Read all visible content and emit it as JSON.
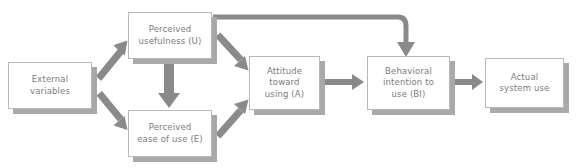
{
  "diagram": {
    "colors": {
      "box_fill": "#ffffff",
      "box_border": "#b9b9b9",
      "shadow": "#a9a9a9",
      "arrow": "#8a8a8a",
      "text": "#7c7c7c",
      "background": "#ffffff"
    },
    "nodes": [
      {
        "id": "external",
        "label": "External\nvariables",
        "x": 8,
        "y": 62,
        "w": 84,
        "h": 47
      },
      {
        "id": "usefulness",
        "label": "Perceived\nusefulness (U)",
        "x": 128,
        "y": 12,
        "w": 84,
        "h": 47
      },
      {
        "id": "ease",
        "label": "Perceived\nease of use (E)",
        "x": 128,
        "y": 110,
        "w": 84,
        "h": 47
      },
      {
        "id": "attitude",
        "label": "Attitude\ntoward\nusing (A)",
        "x": 249,
        "y": 56,
        "w": 71,
        "h": 54
      },
      {
        "id": "intention",
        "label": "Behavioral\nintention to\nuse (BI)",
        "x": 367,
        "y": 56,
        "w": 83,
        "h": 54
      },
      {
        "id": "actual",
        "label": "Actual\nsystem use",
        "x": 485,
        "y": 58,
        "w": 79,
        "h": 50
      }
    ],
    "edges": [
      {
        "id": "external-to-usefulness",
        "from": "external",
        "to": "usefulness",
        "style": "diagonal-up"
      },
      {
        "id": "external-to-ease",
        "from": "external",
        "to": "ease",
        "style": "diagonal-down"
      },
      {
        "id": "usefulness-to-ease",
        "from": "usefulness",
        "to": "ease",
        "style": "vertical-down"
      },
      {
        "id": "usefulness-to-attitude",
        "from": "usefulness",
        "to": "attitude",
        "style": "diagonal-down"
      },
      {
        "id": "ease-to-attitude",
        "from": "ease",
        "to": "attitude",
        "style": "diagonal-up"
      },
      {
        "id": "usefulness-to-intention",
        "from": "usefulness",
        "to": "intention",
        "style": "elbow-over-top"
      },
      {
        "id": "attitude-to-intention",
        "from": "attitude",
        "to": "intention",
        "style": "horizontal"
      },
      {
        "id": "intention-to-actual",
        "from": "intention",
        "to": "actual",
        "style": "horizontal"
      }
    ]
  }
}
